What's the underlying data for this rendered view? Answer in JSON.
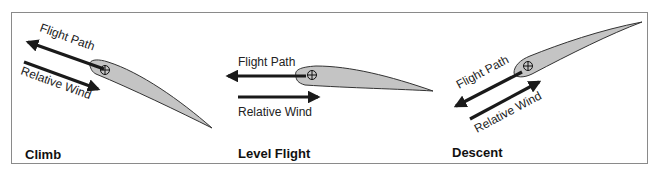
{
  "panels": [
    {
      "id": "climb",
      "title": "Climb",
      "flight_path_label": "Flight Path",
      "relative_wind_label": "Relative Wind"
    },
    {
      "id": "level",
      "title": "Level Flight",
      "flight_path_label": "Flight Path",
      "relative_wind_label": "Relative Wind"
    },
    {
      "id": "descent",
      "title": "Descent",
      "flight_path_label": "Flight Path",
      "relative_wind_label": "Relative Wind"
    }
  ],
  "colors": {
    "airfoil_fill": "#c4c4c4",
    "arrow": "#1a1a1a",
    "border": "#8a8a8a"
  }
}
